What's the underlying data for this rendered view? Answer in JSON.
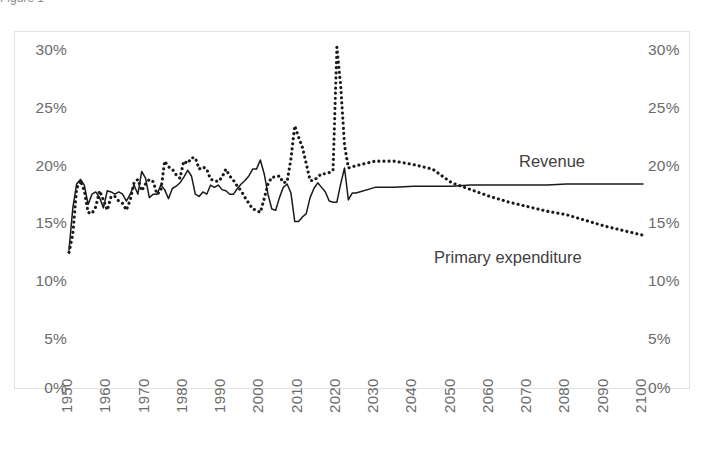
{
  "figure": {
    "caption_partial": "Figure 1",
    "background_color": "#ffffff",
    "frame_border_color": "#e2e2e2",
    "text_color": "#6b6b6b",
    "series_color": "#1a1a1a"
  },
  "chart_data": {
    "type": "line",
    "title": "",
    "subtitle": "",
    "xlabel": "",
    "ylabel": "",
    "xlim": [
      1950,
      2100
    ],
    "ylim": [
      0,
      30
    ],
    "grid": false,
    "legend": "inline-annotations",
    "y_ticks": [
      "0%",
      "5%",
      "10%",
      "15%",
      "20%",
      "25%",
      "30%"
    ],
    "y_tick_values": [
      0,
      5,
      10,
      15,
      20,
      25,
      30
    ],
    "y_axis_left": [
      "0%",
      "5%",
      "10%",
      "15%",
      "20%",
      "25%",
      "30%"
    ],
    "y_axis_right": [
      "0%",
      "5%",
      "10%",
      "15%",
      "20%",
      "25%",
      "30%"
    ],
    "x_ticks": [
      "1950",
      "1960",
      "1970",
      "1980",
      "1990",
      "2000",
      "2010",
      "2020",
      "2030",
      "2040",
      "2050",
      "2060",
      "2070",
      "2080",
      "2090",
      "2100"
    ],
    "x_tick_values": [
      1950,
      1960,
      1970,
      1980,
      1990,
      2000,
      2010,
      2020,
      2030,
      2040,
      2050,
      2060,
      2070,
      2080,
      2090,
      2100
    ],
    "annotations": [
      {
        "text": "Revenue",
        "x": 2062,
        "y": 19.6
      },
      {
        "text": "Primary expenditure",
        "x": 2036,
        "y": 11.9
      }
    ],
    "series": [
      {
        "name": "Revenue",
        "style": "solid",
        "color": "#1a1a1a",
        "x": [
          1950,
          1951,
          1952,
          1953,
          1954,
          1955,
          1956,
          1957,
          1958,
          1959,
          1960,
          1961,
          1962,
          1963,
          1964,
          1965,
          1966,
          1967,
          1968,
          1969,
          1970,
          1971,
          1972,
          1973,
          1974,
          1975,
          1976,
          1977,
          1978,
          1979,
          1980,
          1981,
          1982,
          1983,
          1984,
          1985,
          1986,
          1987,
          1988,
          1989,
          1990,
          1991,
          1992,
          1993,
          1994,
          1995,
          1996,
          1997,
          1998,
          1999,
          2000,
          2001,
          2002,
          2003,
          2004,
          2005,
          2006,
          2007,
          2008,
          2009,
          2010,
          2011,
          2012,
          2013,
          2014,
          2015,
          2016,
          2017,
          2018,
          2019,
          2020,
          2021,
          2022,
          2023,
          2024,
          2025,
          2030,
          2035,
          2040,
          2045,
          2050,
          2055,
          2060,
          2065,
          2070,
          2075,
          2080,
          2085,
          2090,
          2095,
          2100
        ],
        "values": [
          12.1,
          15.8,
          17.9,
          18.3,
          17.8,
          16.1,
          17.0,
          17.2,
          16.7,
          15.8,
          17.3,
          17.2,
          17.0,
          17.2,
          17.0,
          16.4,
          17.0,
          17.8,
          17.0,
          19.0,
          18.4,
          16.7,
          17.0,
          17.0,
          17.8,
          17.4,
          16.6,
          17.5,
          17.7,
          18.0,
          18.5,
          19.1,
          18.6,
          17.0,
          16.8,
          17.2,
          17.0,
          17.8,
          17.6,
          17.8,
          17.4,
          17.3,
          17.0,
          17.0,
          17.5,
          17.9,
          18.2,
          18.6,
          19.2,
          19.2,
          20.0,
          18.8,
          17.0,
          15.7,
          15.6,
          16.7,
          17.6,
          17.9,
          17.1,
          14.6,
          14.6,
          15.0,
          15.3,
          16.7,
          17.5,
          18.0,
          17.6,
          17.2,
          16.4,
          16.3,
          16.3,
          17.9,
          19.3,
          16.5,
          17.1,
          17.1,
          17.6,
          17.6,
          17.7,
          17.7,
          17.7,
          17.8,
          17.8,
          17.8,
          17.8,
          17.8,
          17.9,
          17.9,
          17.9,
          17.9,
          17.9
        ]
      },
      {
        "name": "Primary expenditure",
        "style": "dotted",
        "color": "#1a1a1a",
        "x": [
          1950,
          1951,
          1952,
          1953,
          1954,
          1955,
          1956,
          1957,
          1958,
          1959,
          1960,
          1961,
          1962,
          1963,
          1964,
          1965,
          1966,
          1967,
          1968,
          1969,
          1970,
          1971,
          1972,
          1973,
          1974,
          1975,
          1976,
          1977,
          1978,
          1979,
          1980,
          1981,
          1982,
          1983,
          1984,
          1985,
          1986,
          1987,
          1988,
          1989,
          1990,
          1991,
          1992,
          1993,
          1994,
          1995,
          1996,
          1997,
          1998,
          1999,
          2000,
          2001,
          2002,
          2003,
          2004,
          2005,
          2006,
          2007,
          2008,
          2009,
          2010,
          2011,
          2012,
          2013,
          2014,
          2015,
          2016,
          2017,
          2018,
          2019,
          2020,
          2021,
          2022,
          2023,
          2024,
          2025,
          2030,
          2035,
          2040,
          2045,
          2050,
          2055,
          2060,
          2065,
          2070,
          2075,
          2080,
          2085,
          2090,
          2095,
          2100
        ],
        "values": [
          11.9,
          13.5,
          17.5,
          18.2,
          17.3,
          15.4,
          15.3,
          15.9,
          17.3,
          16.5,
          15.6,
          16.8,
          16.8,
          16.4,
          16.2,
          15.6,
          16.5,
          18.0,
          18.3,
          17.3,
          17.9,
          18.3,
          18.1,
          17.0,
          17.3,
          19.9,
          19.4,
          19.2,
          18.7,
          18.4,
          19.9,
          19.7,
          20.2,
          20.2,
          19.2,
          19.4,
          19.2,
          18.3,
          18.2,
          18.1,
          18.5,
          19.2,
          18.6,
          18.2,
          17.7,
          17.3,
          16.7,
          16.2,
          15.7,
          15.6,
          15.4,
          16.6,
          17.9,
          18.5,
          18.5,
          18.6,
          18.0,
          18.1,
          20.1,
          23.0,
          22.0,
          21.1,
          19.7,
          18.2,
          18.2,
          18.5,
          18.8,
          18.8,
          18.9,
          19.1,
          29.9,
          26.5,
          21.3,
          19.3,
          19.4,
          19.5,
          19.9,
          19.9,
          19.6,
          19.2,
          18.0,
          17.4,
          16.8,
          16.3,
          15.9,
          15.5,
          15.2,
          14.7,
          14.2,
          13.8,
          13.4
        ]
      }
    ]
  }
}
